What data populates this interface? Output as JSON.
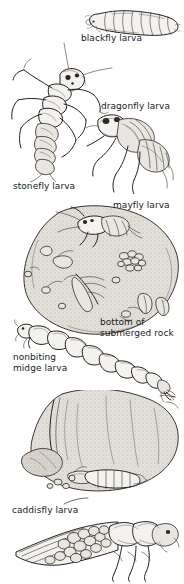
{
  "plate": {
    "title": "Aquatic insect larvae found on and under submerged rocks",
    "background_color": "#ffffff",
    "ink_color": "#23211f",
    "label_color": "#1a1a1a",
    "width": 184,
    "height": 584
  },
  "labels": [
    {
      "id": "blackfly",
      "text": "blackfly larva",
      "x": 81,
      "y": 33
    },
    {
      "id": "dragonfly",
      "text": "dragonfly larva",
      "x": 101,
      "y": 101
    },
    {
      "id": "stonefly",
      "text": "stonefly larva",
      "x": 13,
      "y": 181
    },
    {
      "id": "mayfly",
      "text": "mayfly larva",
      "x": 113,
      "y": 200
    },
    {
      "id": "bottom-of-submerged-rock",
      "text": "bottom of\nsubmerged rock",
      "x": 100,
      "y": 317
    },
    {
      "id": "nonbiting-midge",
      "text": "nonbiting\nmidge larva",
      "x": 13,
      "y": 352
    },
    {
      "id": "caddisfly",
      "text": "caddisfly larva",
      "x": 12,
      "y": 505
    }
  ],
  "figures": [
    {
      "id": "blackfly-larva-figure",
      "name": "blackfly larva illustration",
      "x": 84,
      "y": 5,
      "w": 98,
      "h": 32
    },
    {
      "id": "stonefly-larva-figure",
      "name": "stonefly larva illustration",
      "x": 8,
      "y": 42,
      "w": 112,
      "h": 140
    },
    {
      "id": "dragonfly-larva-figure",
      "name": "dragonfly larva illustration",
      "x": 86,
      "y": 106,
      "w": 98,
      "h": 88
    },
    {
      "id": "submerged-rock-figure",
      "name": "submerged rock with mayfly larva and egg masses",
      "x": 18,
      "y": 200,
      "w": 164,
      "h": 140
    },
    {
      "id": "midge-larva-figure",
      "name": "nonbiting midge larva illustration",
      "x": 14,
      "y": 318,
      "w": 162,
      "h": 84
    },
    {
      "id": "rock-underside-figure",
      "name": "underside of rock with caddisfly cases",
      "x": 10,
      "y": 390,
      "w": 172,
      "h": 125
    },
    {
      "id": "caddisfly-larva-figure",
      "name": "caddisfly larva in stick case illustration",
      "x": 14,
      "y": 508,
      "w": 166,
      "h": 74
    }
  ]
}
